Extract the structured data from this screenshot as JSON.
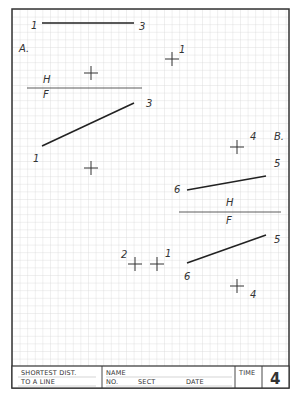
{
  "worksheet": {
    "title_block": {
      "problem_title_line1": "SHORTEST DIST.",
      "problem_title_line2": "TO A LINE",
      "name_label": "NAME",
      "no_label": "NO.",
      "sect_label": "SECT",
      "date_label": "DATE",
      "time_label": "TIME",
      "sheet_number": "4"
    },
    "problem_a": {
      "label": "A.",
      "fold_line": {
        "upper": "H",
        "lower": "F"
      },
      "top_view_line": {
        "start_label": "1",
        "end_label": "3"
      },
      "top_view_point": {
        "label": "1"
      },
      "front_view_line": {
        "start_label": "1",
        "end_label": "3"
      }
    },
    "problem_b": {
      "label": "B.",
      "top_view_point": {
        "label": "4"
      },
      "top_view_line": {
        "start_label": "6",
        "end_label": "5"
      },
      "fold_line": {
        "upper": "H",
        "lower": "F"
      },
      "front_view_points": [
        {
          "label": "2"
        },
        {
          "label": "1"
        }
      ],
      "front_view_line": {
        "start_label": "6",
        "end_label": "5"
      },
      "front_view_point": {
        "label": "4"
      }
    },
    "colors": {
      "grid_line": "#d4d4d4",
      "border": "#333333",
      "drawing_line": "#222222",
      "background": "#ffffff"
    }
  }
}
